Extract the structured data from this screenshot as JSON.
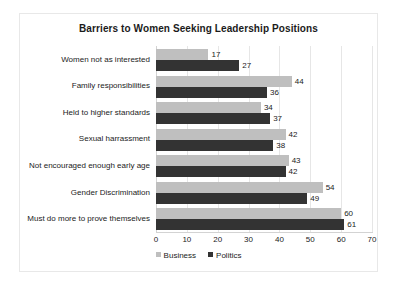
{
  "chart_data": {
    "type": "bar",
    "orientation": "horizontal",
    "title": "Barriers to Women Seeking Leadership Positions",
    "xlabel": "",
    "ylabel": "",
    "xlim": [
      0,
      70
    ],
    "xticks": [
      0,
      10,
      20,
      30,
      40,
      50,
      60,
      70
    ],
    "grid": true,
    "legend_position": "bottom",
    "categories": [
      "Women not as interested",
      "Family responsibilities",
      "Held to higher standards",
      "Sexual harrassment",
      "Not encouraged enough early age",
      "Gender Discrimination",
      "Must do more to prove themselves"
    ],
    "series": [
      {
        "name": "Business",
        "color": "#bfbfbf",
        "values": [
          17,
          44,
          34,
          42,
          43,
          54,
          60
        ]
      },
      {
        "name": "Politics",
        "color": "#333333",
        "values": [
          27,
          36,
          37,
          38,
          42,
          49,
          61
        ]
      }
    ]
  }
}
